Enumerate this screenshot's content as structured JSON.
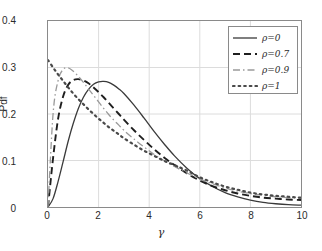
{
  "chart_data": {
    "type": "line",
    "title": "",
    "xlabel": "γ",
    "ylabel": "Pdf",
    "xlim": [
      0,
      10
    ],
    "ylim": [
      0,
      0.4
    ],
    "xticks": [
      "0",
      "2",
      "4",
      "6",
      "8",
      "10"
    ],
    "xtick_values": [
      0,
      2,
      4,
      6,
      8,
      10
    ],
    "yticks": [
      "0",
      "0.1",
      "0.2",
      "0.3",
      "0.4"
    ],
    "ytick_values": [
      0,
      0.1,
      0.2,
      0.3,
      0.4
    ],
    "grid": true,
    "legend_position": "upper right",
    "x": [
      0,
      0.2,
      0.4,
      0.6,
      0.8,
      1.0,
      1.2,
      1.4,
      1.6,
      1.8,
      2.0,
      2.2,
      2.4,
      2.6,
      2.8,
      3.0,
      3.4,
      3.8,
      4.2,
      4.6,
      5.0,
      5.5,
      6.0,
      6.5,
      7.0,
      7.5,
      8.0,
      8.5,
      9.0,
      9.5,
      10.0
    ],
    "series": [
      {
        "name": "ρ=0",
        "label": "ρ=0",
        "style": "solid",
        "color": "#3a3a3a",
        "values": [
          0.0,
          0.018,
          0.055,
          0.098,
          0.142,
          0.18,
          0.212,
          0.236,
          0.253,
          0.264,
          0.269,
          0.27,
          0.268,
          0.262,
          0.254,
          0.244,
          0.219,
          0.191,
          0.162,
          0.135,
          0.11,
          0.083,
          0.061,
          0.044,
          0.031,
          0.022,
          0.015,
          0.01,
          0.007,
          0.005,
          0.004
        ]
      },
      {
        "name": "ρ=0.7",
        "label": "ρ=0.7",
        "style": "dashed",
        "color": "#1f1f1f",
        "values": [
          0.0,
          0.105,
          0.19,
          0.238,
          0.263,
          0.273,
          0.275,
          0.272,
          0.266,
          0.257,
          0.247,
          0.236,
          0.224,
          0.212,
          0.2,
          0.188,
          0.165,
          0.144,
          0.124,
          0.106,
          0.09,
          0.072,
          0.057,
          0.045,
          0.036,
          0.029,
          0.024,
          0.02,
          0.018,
          0.016,
          0.015
        ]
      },
      {
        "name": "ρ=0.9",
        "label": "ρ=0.9",
        "style": "dashdot",
        "color": "#9a9a9a",
        "values": [
          0.0,
          0.2,
          0.272,
          0.296,
          0.299,
          0.292,
          0.281,
          0.268,
          0.254,
          0.24,
          0.226,
          0.212,
          0.199,
          0.187,
          0.176,
          0.165,
          0.146,
          0.129,
          0.113,
          0.099,
          0.087,
          0.073,
          0.06,
          0.05,
          0.041,
          0.034,
          0.029,
          0.025,
          0.022,
          0.02,
          0.019
        ]
      },
      {
        "name": "ρ=1",
        "label": "ρ=1",
        "style": "dotted",
        "color": "#4a4a4a",
        "values": [
          0.316,
          0.3,
          0.285,
          0.271,
          0.257,
          0.244,
          0.232,
          0.221,
          0.21,
          0.2,
          0.19,
          0.181,
          0.172,
          0.164,
          0.156,
          0.148,
          0.134,
          0.121,
          0.11,
          0.099,
          0.09,
          0.078,
          0.064,
          0.053,
          0.044,
          0.037,
          0.031,
          0.027,
          0.024,
          0.022,
          0.02
        ]
      }
    ]
  },
  "axes": {
    "ylabel": "Pdf",
    "xlabel": "γ"
  },
  "legend": {
    "items": [
      {
        "label": "ρ=0",
        "style": "solid"
      },
      {
        "label": "ρ=0.7",
        "style": "dashed"
      },
      {
        "label": "ρ=0.9",
        "style": "dashdot"
      },
      {
        "label": "ρ=1",
        "style": "dotted"
      }
    ]
  },
  "colors": {
    "frame": "#8a8a8a",
    "grid": "#dcdcdc",
    "text": "#2b2b2b",
    "background": "#ffffff"
  }
}
